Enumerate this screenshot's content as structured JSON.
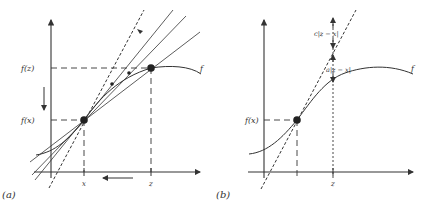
{
  "panel_a": {
    "caption": "(a)",
    "label_fz": "f(z)",
    "label_fx": "f(x)",
    "tick_x": "x",
    "tick_z": "z",
    "curve_label": "f"
  },
  "panel_b": {
    "caption": "(b)",
    "label_fx": "f(x)",
    "tick_z": "z",
    "curve_label": "f",
    "upper_bound_label": "c|z − x|",
    "lower_bound_label": "a|z − x|"
  },
  "colors": {
    "ink": "#333333",
    "background": "#ffffff"
  }
}
